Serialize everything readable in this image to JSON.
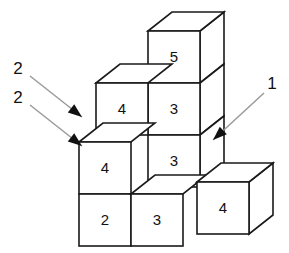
{
  "figure": {
    "background_color": "#ffffff",
    "edge_color": "#1a1a1a",
    "face_color": "#ffffff",
    "arrow_line_color": "#9a9a9a",
    "arrow_head_color": "#111111",
    "text_color": "#111111"
  },
  "cubes": [
    {
      "id": "cube-top-5",
      "label": "5",
      "face_x": 148,
      "face_y": 31,
      "size": 52,
      "depth_dx": 24,
      "depth_dy": -19,
      "show_top": true,
      "show_side": true
    },
    {
      "id": "cube-mid-upper-3",
      "label": "3",
      "face_x": 148,
      "face_y": 83,
      "size": 52,
      "depth_dx": 24,
      "depth_dy": -19,
      "show_top": false,
      "show_side": true
    },
    {
      "id": "cube-mid-lower-3",
      "label": "3",
      "face_x": 148,
      "face_y": 135,
      "size": 52,
      "depth_dx": 24,
      "depth_dy": -19,
      "show_top": false,
      "show_side": true
    },
    {
      "id": "cube-left-upper-4",
      "label": "4",
      "face_x": 96,
      "face_y": 83,
      "size": 52,
      "depth_dx": 24,
      "depth_dy": -19,
      "show_top": true,
      "show_side": false
    },
    {
      "id": "cube-left-lower-4",
      "label": "4",
      "face_x": 79,
      "face_y": 142,
      "size": 52,
      "depth_dx": 24,
      "depth_dy": -19,
      "show_top": true,
      "show_side": false
    },
    {
      "id": "cube-bottom-2",
      "label": "2",
      "face_x": 79,
      "face_y": 194,
      "size": 52,
      "depth_dx": 24,
      "depth_dy": -19,
      "show_top": false,
      "show_side": false
    },
    {
      "id": "cube-bottom-3",
      "label": "3",
      "face_x": 131,
      "face_y": 194,
      "size": 52,
      "depth_dx": 24,
      "depth_dy": -19,
      "show_top": true,
      "show_side": false
    },
    {
      "id": "cube-right-4",
      "label": "4",
      "face_x": 197,
      "face_y": 182,
      "size": 52,
      "depth_dx": 24,
      "depth_dy": -19,
      "show_top": true,
      "show_side": true
    }
  ],
  "annotations": [
    {
      "id": "arrow-label-2-upper",
      "label": "2",
      "label_x": 18,
      "label_y": 70,
      "line_x1": 30,
      "line_y1": 76,
      "line_x2": 82,
      "line_y2": 117,
      "head_angle_deg": 38
    },
    {
      "id": "arrow-label-2-lower",
      "label": "2",
      "label_x": 18,
      "label_y": 99,
      "line_x1": 30,
      "line_y1": 105,
      "line_x2": 82,
      "line_y2": 146,
      "head_angle_deg": 38
    },
    {
      "id": "arrow-label-1-right",
      "label": "1",
      "label_x": 272,
      "label_y": 85,
      "line_x1": 264,
      "line_y1": 93,
      "line_x2": 213,
      "line_y2": 140,
      "head_angle_deg": 222
    }
  ],
  "values_summary": {
    "cube_values": [
      5,
      3,
      3,
      4,
      4,
      2,
      3,
      4
    ],
    "arrow_values": [
      2,
      2,
      1
    ]
  }
}
